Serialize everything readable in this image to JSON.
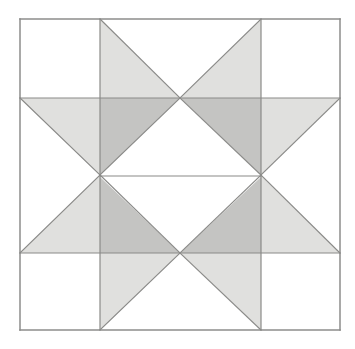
{
  "figure": {
    "kind": "geometric-pattern",
    "canvas": {
      "width": 355,
      "height": 349,
      "background": "#ffffff"
    },
    "colors": {
      "background": "#ffffff",
      "light_gray": "#e0e0de",
      "dark_gray": "#c4c4c2",
      "outline": "#8a8a88",
      "outer_border": "#8d8d8b"
    },
    "geometry": {
      "outer_square": {
        "x0": 20,
        "y0": 19,
        "x1": 340,
        "y1": 330
      },
      "vertical_gridlines": [
        100,
        261
      ],
      "horizontal_gridlines": [
        98,
        253
      ],
      "center_midline_y": 175,
      "center_midline_x": 180,
      "stroke_width": 1.2,
      "outer_stroke_width": 1.5
    },
    "cells": [
      {
        "name": "top-left",
        "row": 0,
        "col": 0,
        "fill": "none"
      },
      {
        "name": "top-center",
        "row": 0,
        "col": 1,
        "fill": "two-light-triangles"
      },
      {
        "name": "top-right",
        "row": 0,
        "col": 2,
        "fill": "none"
      },
      {
        "name": "middle-left",
        "row": 1,
        "col": 0,
        "fill": "light-triangle"
      },
      {
        "name": "middle-center",
        "row": 1,
        "col": 1,
        "fill": "dark-quad-star"
      },
      {
        "name": "middle-right",
        "row": 1,
        "col": 2,
        "fill": "light-triangle"
      },
      {
        "name": "bottom-left",
        "row": 2,
        "col": 0,
        "fill": "none"
      },
      {
        "name": "bottom-center",
        "row": 2,
        "col": 1,
        "fill": "two-light-triangles"
      },
      {
        "name": "bottom-right",
        "row": 2,
        "col": 2,
        "fill": "none"
      }
    ],
    "shapes": {
      "light_polygons": [
        {
          "id": "star-point-top-left",
          "points": "100,19 180,98 100,98"
        },
        {
          "id": "star-point-top-right",
          "points": "261,19 261,98 180,98"
        },
        {
          "id": "star-arm-west-upper",
          "points": "20,98 100,98 100,175"
        },
        {
          "id": "star-arm-east-upper",
          "points": "261,98 340,98 261,175"
        },
        {
          "id": "star-arm-west-lower",
          "points": "20,253 100,175 100,253"
        },
        {
          "id": "star-arm-east-lower",
          "points": "340,253 261,175 261,253"
        },
        {
          "id": "star-point-bottom-left",
          "points": "100,253 180,253 100,330"
        },
        {
          "id": "star-point-bottom-right",
          "points": "261,253 261,330 180,253"
        }
      ],
      "dark_polygons": [
        {
          "id": "center-upper-left",
          "points": "100,98 180,98 100,175"
        },
        {
          "id": "center-upper-right",
          "points": "261,98 261,175 180,98"
        },
        {
          "id": "center-lower-left",
          "points": "100,175 180,253 100,253"
        },
        {
          "id": "center-lower-right",
          "points": "261,175 261,253 180,253"
        }
      ],
      "white_polygons": [
        {
          "id": "center-diamond-upper",
          "points": "100,175 180,98 261,175"
        },
        {
          "id": "center-diamond-lower",
          "points": "100,177 261,177 180,253"
        },
        {
          "id": "top-center-notch",
          "points": "100,19 261,19 180,98"
        },
        {
          "id": "bottom-center-notch",
          "points": "180,253 261,330 100,330"
        }
      ],
      "outline_segments": [
        {
          "id": "border-top",
          "x1": 20,
          "y1": 19,
          "x2": 340,
          "y2": 19
        },
        {
          "id": "border-right",
          "x1": 340,
          "y1": 19,
          "x2": 340,
          "y2": 330
        },
        {
          "id": "border-bottom",
          "x1": 340,
          "y1": 330,
          "x2": 20,
          "y2": 330
        },
        {
          "id": "border-left",
          "x1": 20,
          "y1": 330,
          "x2": 20,
          "y2": 19
        },
        {
          "id": "grid-h-upper",
          "x1": 20,
          "y1": 98,
          "x2": 340,
          "y2": 98
        },
        {
          "id": "grid-h-lower",
          "x1": 20,
          "y1": 253,
          "x2": 340,
          "y2": 253
        },
        {
          "id": "grid-v-left",
          "x1": 100,
          "y1": 19,
          "x2": 100,
          "y2": 330
        },
        {
          "id": "grid-v-right",
          "x1": 261,
          "y1": 19,
          "x2": 261,
          "y2": 330
        },
        {
          "id": "diag-tc-left",
          "x1": 100,
          "y1": 19,
          "x2": 180,
          "y2": 98
        },
        {
          "id": "diag-tc-right",
          "x1": 261,
          "y1": 19,
          "x2": 180,
          "y2": 98
        },
        {
          "id": "diag-bc-left",
          "x1": 100,
          "y1": 330,
          "x2": 180,
          "y2": 253
        },
        {
          "id": "diag-bc-right",
          "x1": 261,
          "y1": 330,
          "x2": 180,
          "y2": 253
        },
        {
          "id": "diag-ml-upper",
          "x1": 20,
          "y1": 98,
          "x2": 100,
          "y2": 175
        },
        {
          "id": "diag-ml-lower",
          "x1": 20,
          "y1": 253,
          "x2": 100,
          "y2": 175
        },
        {
          "id": "diag-mr-upper",
          "x1": 340,
          "y1": 98,
          "x2": 261,
          "y2": 175
        },
        {
          "id": "diag-mr-lower",
          "x1": 340,
          "y1": 253,
          "x2": 261,
          "y2": 175
        },
        {
          "id": "diag-cc-ul",
          "x1": 100,
          "y1": 175,
          "x2": 180,
          "y2": 98
        },
        {
          "id": "diag-cc-ur",
          "x1": 261,
          "y1": 175,
          "x2": 180,
          "y2": 98
        },
        {
          "id": "diag-cc-ll",
          "x1": 100,
          "y1": 175,
          "x2": 180,
          "y2": 253
        },
        {
          "id": "diag-cc-lr",
          "x1": 261,
          "y1": 175,
          "x2": 180,
          "y2": 253
        },
        {
          "id": "center-midline",
          "x1": 100,
          "y1": 176,
          "x2": 261,
          "y2": 176
        }
      ]
    }
  }
}
